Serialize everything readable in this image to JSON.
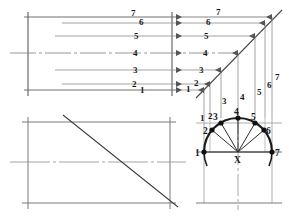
{
  "drawing": {
    "title": "Helix / sine-curve development construction",
    "sheet": {
      "width": 289,
      "height": 222,
      "background": "#ffffff"
    },
    "colors": {
      "construction_line": "#7a7a7a",
      "object_line": "#4a4a4a",
      "center_line": "#8a8a8a",
      "heavy_arc": "#1a1a1a",
      "point_marker": "#111111",
      "label_text": "#1a1a1a"
    },
    "views": {
      "development": {
        "name": "development-view",
        "label": "Upper-left development grid",
        "ordinate_labels": [
          "1",
          "2",
          "3",
          "4",
          "5",
          "6",
          "7"
        ]
      },
      "projection": {
        "name": "projection-view",
        "label": "Upper-right projection with diagonal",
        "ordinate_labels": [
          "1",
          "2",
          "3",
          "4",
          "5",
          "6",
          "7"
        ],
        "vertical_labels": [
          "1",
          "2",
          "3",
          "4",
          "5",
          "6",
          "7"
        ]
      },
      "elevation": {
        "name": "elevation-view",
        "label": "Lower-left rectangle with diagonal"
      },
      "plan": {
        "name": "plan-view",
        "label": "Lower-right semicircle divided into seven points",
        "center_label": "X",
        "division_labels": [
          "1",
          "2",
          "3",
          "4",
          "5",
          "6",
          "7"
        ]
      }
    },
    "semicircle": {
      "center_x": 238,
      "center_y": 152,
      "radius": 34,
      "divisions": 6,
      "points": [
        {
          "id": "1",
          "x": 204,
          "y": 152,
          "label_x": 196,
          "label_y": 156
        },
        {
          "id": "2",
          "x": 221,
          "y": 123,
          "label_x": 212,
          "label_y": 126
        },
        {
          "id": "3",
          "x": 221,
          "y": 123,
          "label_x": 213,
          "label_y": 116
        },
        {
          "id": "4",
          "x": 238,
          "y": 118,
          "label_x": 233,
          "label_y": 113
        },
        {
          "id": "5",
          "x": 255,
          "y": 123,
          "label_x": 251,
          "label_y": 117
        },
        {
          "id": "6",
          "x": 255,
          "y": 123,
          "label_x": 261,
          "label_y": 127
        },
        {
          "id": "7",
          "x": 272,
          "y": 152,
          "label_x": 275,
          "label_y": 156
        }
      ]
    },
    "ordinates": {
      "heights_y": [
        90,
        84,
        70,
        53,
        36,
        23,
        17
      ],
      "x_positions": [
        204,
        210,
        221,
        238,
        255,
        265,
        272
      ]
    }
  }
}
